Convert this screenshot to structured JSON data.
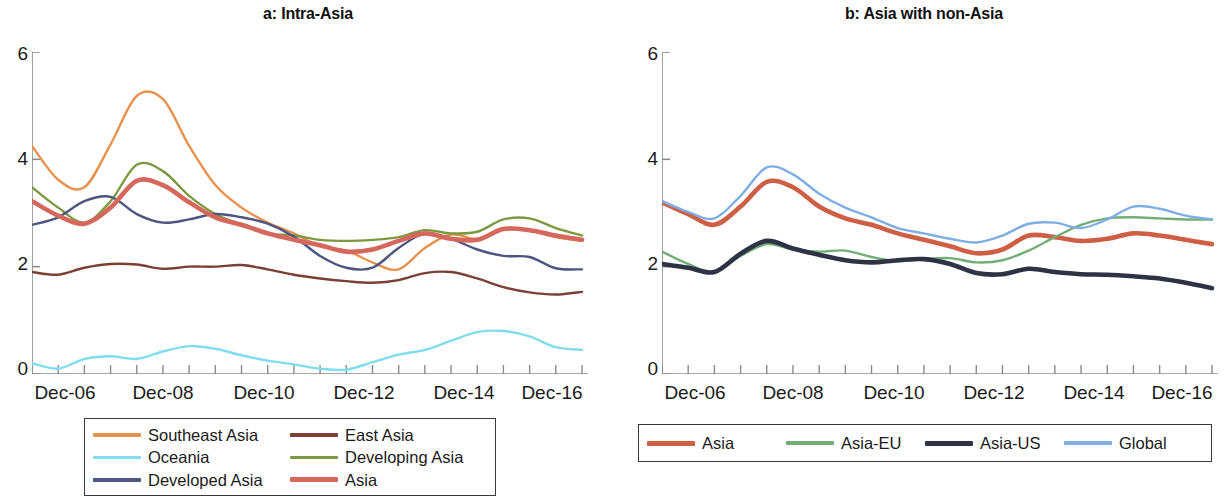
{
  "figure": {
    "panels": [
      {
        "id": "a",
        "title": "a: Intra-Asia"
      },
      {
        "id": "b",
        "title": "b: Asia with non-Asia"
      }
    ]
  },
  "axis": {
    "y_ticks": [
      "0",
      "2",
      "4",
      "6"
    ],
    "x_ticks": [
      "Dec-06",
      "Dec-08",
      "Dec-10",
      "Dec-12",
      "Dec-14",
      "Dec-16"
    ]
  },
  "legend_a": {
    "items": [
      {
        "label": "Southeast Asia",
        "color": "#E8924F",
        "thick": false
      },
      {
        "label": "East Asia",
        "color": "#7B4034",
        "thick": false
      },
      {
        "label": "Oceania",
        "color": "#7FDDEE",
        "thick": false
      },
      {
        "label": "Developing Asia",
        "color": "#7C9940",
        "thick": false
      },
      {
        "label": "Developed Asia",
        "color": "#4C5680",
        "thick": false
      },
      {
        "label": "Asia",
        "color": "#D5675C",
        "thick": true
      }
    ]
  },
  "legend_b": {
    "items": [
      {
        "label": "Asia",
        "color": "#CE5F45",
        "thick": true
      },
      {
        "label": "Asia-EU",
        "color": "#73AE78",
        "thick": false
      },
      {
        "label": "Asia-US",
        "color": "#2E3344",
        "thick": true
      },
      {
        "label": "Global",
        "color": "#7FAEE4",
        "thick": false
      }
    ]
  },
  "chart_data": [
    {
      "type": "line",
      "title": "a: Intra-Asia",
      "xlabel": "",
      "ylabel": "",
      "ylim": [
        0,
        6
      ],
      "yticks": [
        0,
        2,
        4,
        6
      ],
      "grid": false,
      "legend_position": "bottom",
      "x": [
        "Dec-06",
        "Jun-07",
        "Dec-07",
        "Jun-08",
        "Dec-08",
        "Jun-09",
        "Dec-09",
        "Jun-10",
        "Dec-10",
        "Jun-11",
        "Dec-11",
        "Jun-12",
        "Dec-12",
        "Jun-13",
        "Dec-13",
        "Jun-14",
        "Dec-14",
        "Jun-15",
        "Dec-15",
        "Jun-16",
        "Dec-16",
        "Jun-17"
      ],
      "xtick_labels": [
        "Dec-06",
        "Dec-08",
        "Dec-10",
        "Dec-12",
        "Dec-14",
        "Dec-16"
      ],
      "series": [
        {
          "name": "Southeast Asia",
          "color": "#E8924F",
          "values": [
            4.25,
            3.62,
            3.48,
            4.28,
            5.18,
            5.12,
            4.25,
            3.52,
            3.1,
            2.82,
            2.62,
            2.38,
            2.3,
            2.08,
            1.95,
            2.35,
            2.6,
            2.52,
            2.72,
            2.68,
            2.55,
            2.48
          ]
        },
        {
          "name": "East Asia",
          "color": "#7B4034",
          "values": [
            1.9,
            1.85,
            1.98,
            2.05,
            2.04,
            1.96,
            2.0,
            2.0,
            2.03,
            1.95,
            1.85,
            1.78,
            1.73,
            1.7,
            1.75,
            1.88,
            1.9,
            1.78,
            1.62,
            1.52,
            1.48,
            1.53
          ]
        },
        {
          "name": "Oceania",
          "color": "#7FDDEE",
          "values": [
            0.2,
            0.1,
            0.28,
            0.33,
            0.28,
            0.42,
            0.52,
            0.47,
            0.35,
            0.25,
            0.18,
            0.1,
            0.08,
            0.22,
            0.36,
            0.45,
            0.62,
            0.78,
            0.8,
            0.7,
            0.5,
            0.45
          ]
        },
        {
          "name": "Developing Asia",
          "color": "#7C9940",
          "values": [
            3.48,
            3.1,
            2.82,
            3.22,
            3.9,
            3.78,
            3.32,
            2.98,
            2.78,
            2.62,
            2.58,
            2.5,
            2.48,
            2.5,
            2.55,
            2.68,
            2.62,
            2.65,
            2.88,
            2.9,
            2.72,
            2.58
          ]
        },
        {
          "name": "Developed Asia",
          "color": "#4C5680",
          "values": [
            2.78,
            2.92,
            3.22,
            3.3,
            2.98,
            2.82,
            2.88,
            2.98,
            2.92,
            2.8,
            2.56,
            2.2,
            1.98,
            1.98,
            2.35,
            2.62,
            2.52,
            2.32,
            2.2,
            2.18,
            1.97,
            1.95
          ]
        },
        {
          "name": "Asia",
          "color": "#D5675C",
          "values": [
            3.22,
            2.95,
            2.8,
            3.1,
            3.6,
            3.52,
            3.2,
            2.92,
            2.78,
            2.62,
            2.5,
            2.4,
            2.28,
            2.32,
            2.48,
            2.62,
            2.52,
            2.5,
            2.7,
            2.68,
            2.58,
            2.5
          ]
        }
      ]
    },
    {
      "type": "line",
      "title": "b: Asia with non-Asia",
      "xlabel": "",
      "ylabel": "",
      "ylim": [
        0,
        6
      ],
      "yticks": [
        0,
        2,
        4,
        6
      ],
      "grid": false,
      "legend_position": "bottom",
      "x": [
        "Dec-06",
        "Jun-07",
        "Dec-07",
        "Jun-08",
        "Dec-08",
        "Jun-09",
        "Dec-09",
        "Jun-10",
        "Dec-10",
        "Jun-11",
        "Dec-11",
        "Jun-12",
        "Dec-12",
        "Jun-13",
        "Dec-13",
        "Jun-14",
        "Dec-14",
        "Jun-15",
        "Dec-15",
        "Jun-16",
        "Dec-16",
        "Jun-17"
      ],
      "xtick_labels": [
        "Dec-06",
        "Dec-08",
        "Dec-10",
        "Dec-12",
        "Dec-14",
        "Dec-16"
      ],
      "series": [
        {
          "name": "Asia",
          "color": "#CE5F45",
          "values": [
            3.2,
            2.98,
            2.78,
            3.12,
            3.58,
            3.48,
            3.12,
            2.9,
            2.78,
            2.62,
            2.5,
            2.38,
            2.25,
            2.32,
            2.58,
            2.55,
            2.48,
            2.52,
            2.62,
            2.58,
            2.5,
            2.42
          ]
        },
        {
          "name": "Asia-EU",
          "color": "#73AE78",
          "values": [
            2.28,
            2.05,
            1.9,
            2.2,
            2.42,
            2.32,
            2.28,
            2.3,
            2.18,
            2.1,
            2.14,
            2.16,
            2.08,
            2.12,
            2.3,
            2.55,
            2.78,
            2.9,
            2.92,
            2.9,
            2.88,
            2.88
          ]
        },
        {
          "name": "Asia-US",
          "color": "#2E3344",
          "values": [
            2.05,
            1.98,
            1.9,
            2.24,
            2.48,
            2.34,
            2.22,
            2.12,
            2.08,
            2.12,
            2.14,
            2.05,
            1.88,
            1.86,
            1.96,
            1.9,
            1.86,
            1.85,
            1.82,
            1.78,
            1.7,
            1.6
          ]
        },
        {
          "name": "Global",
          "color": "#7FAEE4",
          "values": [
            3.22,
            3.02,
            2.9,
            3.32,
            3.85,
            3.72,
            3.36,
            3.1,
            2.92,
            2.72,
            2.62,
            2.52,
            2.45,
            2.58,
            2.8,
            2.82,
            2.72,
            2.88,
            3.12,
            3.08,
            2.95,
            2.88
          ]
        }
      ]
    }
  ]
}
